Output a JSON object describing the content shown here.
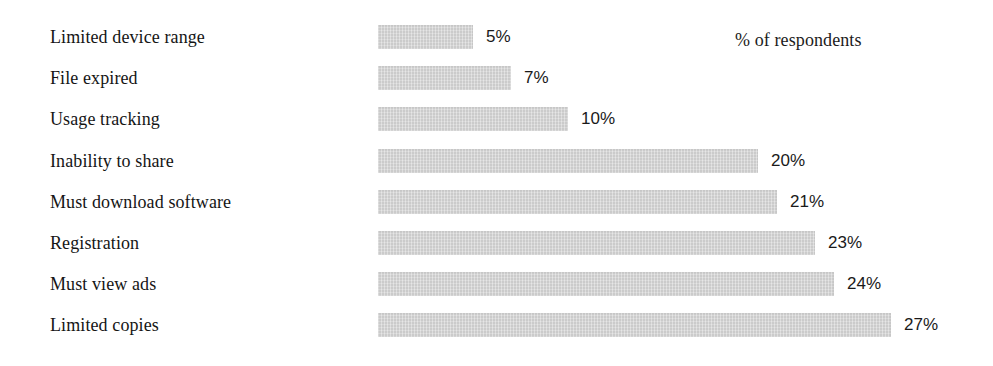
{
  "chart_data": {
    "type": "bar",
    "orientation": "horizontal",
    "title": "",
    "subtitle": "",
    "xlabel": "",
    "ylabel": "",
    "annotation": "% of respondents",
    "grid": false,
    "legend": null,
    "xlim": [
      0,
      27
    ],
    "value_suffix": "%",
    "bar_color": "#d2d2d2",
    "text_color": "#151515",
    "background": "#ffffff",
    "categories": [
      "Limited device range",
      "File expired",
      "Usage tracking",
      "Inability to share",
      "Must download software",
      "Registration",
      "Must view ads",
      "Limited copies"
    ],
    "values": [
      5,
      7,
      10,
      20,
      21,
      23,
      24,
      27
    ],
    "value_labels": [
      "5%",
      "7%",
      "10%",
      "20%",
      "21%",
      "23%",
      "24%",
      "27%"
    ]
  }
}
